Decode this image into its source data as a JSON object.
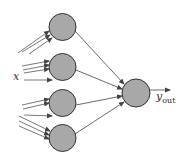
{
  "diagram": {
    "type": "neural-network",
    "colors": {
      "node_fill": "#a8a8a8",
      "node_stroke": "#333333",
      "edge": "#444444",
      "background": "#ffffff"
    },
    "labels": {
      "input": "x",
      "output_main": "y",
      "output_sub": "out"
    },
    "hidden_nodes": [
      {
        "id": "h1",
        "cx": 62.5,
        "cy": 27,
        "r": 13.5
      },
      {
        "id": "h2",
        "cx": 62.5,
        "cy": 67,
        "r": 13.5
      },
      {
        "id": "h3",
        "cx": 62.5,
        "cy": 103,
        "r": 13.5
      },
      {
        "id": "h4",
        "cx": 62.5,
        "cy": 138,
        "r": 13.5
      }
    ],
    "output_node": {
      "id": "out",
      "cx": 136,
      "cy": 93,
      "r": 14
    }
  }
}
